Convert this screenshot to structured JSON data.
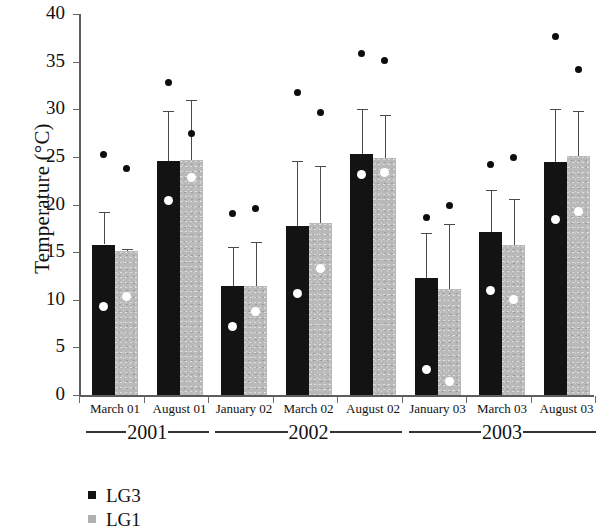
{
  "chart_data": {
    "type": "bar",
    "title": "",
    "xlabel": "",
    "ylabel": "Temperature (°C)",
    "ylim": [
      0,
      40
    ],
    "yticks": [
      0,
      5,
      10,
      15,
      20,
      25,
      30,
      35,
      40
    ],
    "ytick_labels": [
      "0",
      "5",
      "10",
      "15",
      "20",
      "25",
      "30",
      "35",
      "40"
    ],
    "grid": false,
    "legend_position": "below-left",
    "categories": [
      "March 01",
      "August 01",
      "January 02",
      "March 02",
      "August 02",
      "January 03",
      "March 03",
      "August 03"
    ],
    "group_labels": [
      {
        "label": "2001",
        "categories": [
          "March 01",
          "August 01"
        ]
      },
      {
        "label": "2002",
        "categories": [
          "January 02",
          "March 02",
          "August 02"
        ]
      },
      {
        "label": "2003",
        "categories": [
          "January 03",
          "March 03",
          "August 03"
        ]
      }
    ],
    "series": [
      {
        "name": "LG3",
        "color": "#131313",
        "values": [
          15.8,
          24.6,
          11.4,
          17.7,
          25.3,
          12.3,
          17.1,
          24.5
        ],
        "error_upper": [
          19.2,
          29.8,
          15.5,
          24.6,
          30.0,
          17.0,
          21.5,
          30.0
        ],
        "white_marker_values": [
          9.3,
          20.4,
          7.2,
          10.7,
          23.1,
          2.7,
          11.0,
          18.4
        ],
        "black_marker_values": [
          25.2,
          32.8,
          19.1,
          31.8,
          35.9,
          18.6,
          24.2,
          37.6
        ]
      },
      {
        "name": "LG1",
        "color": "#b9b9b9",
        "values": [
          15.1,
          24.7,
          11.4,
          18.1,
          24.9,
          11.1,
          15.7,
          25.1
        ],
        "error_upper": [
          15.3,
          31.0,
          16.1,
          24.0,
          29.4,
          18.0,
          20.6,
          29.8
        ],
        "white_marker_values": [
          10.3,
          22.8,
          8.8,
          13.3,
          23.4,
          1.4,
          10.0,
          19.3
        ],
        "black_marker_values": [
          23.8,
          27.5,
          19.6,
          29.7,
          35.1,
          19.9,
          24.9,
          34.2
        ]
      }
    ],
    "notes": {
      "white_marker_meaning": "white circle point within bar",
      "black_marker_meaning": "black circle point above bars"
    }
  },
  "legend": {
    "items": [
      {
        "label": "LG3",
        "swatch": "lg3"
      },
      {
        "label": "LG1",
        "swatch": "lg1"
      }
    ]
  },
  "axis": {
    "y_title": "Temperature (°C)"
  }
}
